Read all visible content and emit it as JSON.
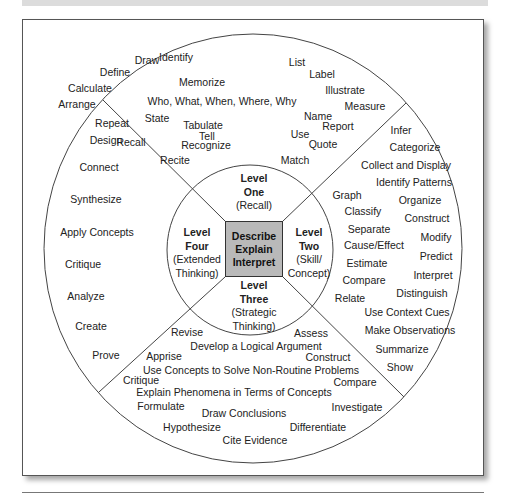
{
  "center": {
    "lines": [
      "Describe",
      "Explain",
      "Interpret"
    ]
  },
  "levels": [
    {
      "id": "one",
      "title1": "Level",
      "title2": "One",
      "sub1": "(Recall)",
      "sub2": ""
    },
    {
      "id": "two",
      "title1": "Level",
      "title2": "Two",
      "sub1": "(Skill/",
      "sub2": "Concept)"
    },
    {
      "id": "three",
      "title1": "Level",
      "title2": "Three",
      "sub1": "(Strategic",
      "sub2": "Thinking)"
    },
    {
      "id": "four",
      "title1": "Level",
      "title2": "Four",
      "sub1": "(Extended",
      "sub2": "Thinking)"
    }
  ],
  "level_one_words": [
    "Draw",
    "Identify",
    "List",
    "Label",
    "Define",
    "Memorize",
    "Illustrate",
    "Calculate",
    "Who, What, When, Where, Why",
    "Measure",
    "Arrange",
    "Repeat",
    "State",
    "Name",
    "Report",
    "Tabulate",
    "Tell",
    "Recall",
    "Recognize",
    "Use",
    "Quote",
    "Recite",
    "Match"
  ],
  "level_two_words": [
    "Infer",
    "Categorize",
    "Collect and Display",
    "Identify Patterns",
    "Graph",
    "Organize",
    "Classify",
    "Construct",
    "Separate",
    "Modify",
    "Cause/Effect",
    "Predict",
    "Estimate",
    "Interpret",
    "Compare",
    "Distinguish",
    "Relate",
    "Use Context Cues",
    "Make Observations",
    "Summarize",
    "Show"
  ],
  "level_three_words": [
    "Revise",
    "Assess",
    "Develop a Logical Argument",
    "Apprise",
    "Construct",
    "Use Concepts to Solve Non-Routine Problems",
    "Critique",
    "Compare",
    "Explain Phenomena in Terms of Concepts",
    "Formulate",
    "Investigate",
    "Draw Conclusions",
    "Hypothesize",
    "Differentiate",
    "Cite Evidence"
  ],
  "level_four_words": [
    "Design",
    "Connect",
    "Synthesize",
    "Apply Concepts",
    "Critique",
    "Analyze",
    "Create",
    "Prove"
  ]
}
